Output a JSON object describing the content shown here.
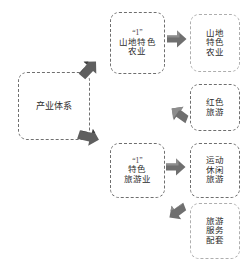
{
  "diagram": {
    "colors": {
      "node_border_dark": "#6e6e6e",
      "node_border_light": "#aeaeae",
      "arrow_fill": "#6f6f6f",
      "arrow_fill_light": "#9b9b9b",
      "text": "#2b2b2b",
      "background": "#ffffff"
    },
    "root": {
      "label": "产业体系"
    },
    "pillars": [
      {
        "quote": "“1”",
        "label": "山地特色\n农业"
      },
      {
        "quote": "“1”",
        "label": "特色\n旅游业"
      }
    ],
    "outcomes": [
      {
        "label": "山地\n特色\n农业"
      },
      {
        "label": "红色\n旅游"
      },
      {
        "label": "运动\n休闲\n旅游"
      },
      {
        "label": "旅游\n服务\n配套"
      }
    ],
    "arrows": [
      {
        "name": "arrow-root-to-pillar-1",
        "direction": "up-right"
      },
      {
        "name": "arrow-root-to-pillar-2",
        "direction": "down-right"
      },
      {
        "name": "arrow-pillar-1-to-outcome-1",
        "direction": "right"
      },
      {
        "name": "arrow-pillar-2-to-outcome-2",
        "direction": "left-up"
      },
      {
        "name": "arrow-pillar-2-to-outcome-3",
        "direction": "right"
      },
      {
        "name": "arrow-pillar-2-to-outcome-4",
        "direction": "left-down"
      }
    ]
  }
}
